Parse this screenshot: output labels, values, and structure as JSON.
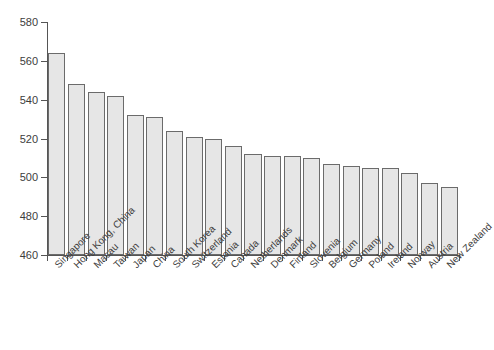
{
  "chart_data": {
    "type": "bar",
    "title": "",
    "subtitle": "",
    "xlabel": "",
    "ylabel": "",
    "ylim": [
      460,
      580
    ],
    "yticks": [
      460,
      480,
      500,
      520,
      540,
      560,
      580
    ],
    "grid": false,
    "legend": false,
    "categories": [
      "Singapore",
      "Hong Kong, China",
      "Macau",
      "Taiwan",
      "Japan",
      "China",
      "South Korea",
      "Switzerland",
      "Estonia",
      "Canada",
      "Netherlands",
      "Denmark",
      "Finland",
      "Slovenia",
      "Belgium",
      "Germany",
      "Poland",
      "Ireland",
      "Norway",
      "Austria",
      "New Zealand"
    ],
    "values": [
      564,
      548,
      544,
      542,
      532,
      531,
      524,
      521,
      520,
      516,
      512,
      511,
      511,
      510,
      507,
      506,
      505,
      505,
      502,
      497,
      495
    ],
    "bar_fill_color": "#e6e6e6",
    "bar_edge_color": "#6b6b6b",
    "axis_color": "#555555",
    "text_color": "#3d3d3d",
    "background_color": "#ffffff"
  }
}
